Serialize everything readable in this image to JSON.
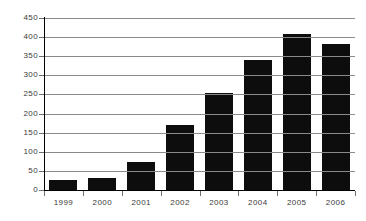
{
  "chart_data": {
    "type": "bar",
    "title": "",
    "subtitle": "",
    "xlabel": "",
    "ylabel": "",
    "categories": [
      "1999",
      "2000",
      "2001",
      "2002",
      "2003",
      "2004",
      "2005",
      "2006"
    ],
    "values": [
      27,
      32,
      74,
      171,
      253,
      340,
      407,
      383
    ],
    "series": [
      {
        "name": "",
        "values": [
          27,
          32,
          74,
          171,
          253,
          340,
          407,
          383
        ]
      }
    ],
    "ylim": [
      0,
      450
    ],
    "ytick_values": [
      0,
      50,
      100,
      150,
      200,
      250,
      300,
      350,
      400,
      450
    ],
    "ytick_labels": [
      "0",
      "50",
      "100",
      "150",
      "200",
      "250",
      "300",
      "350",
      "400",
      "450"
    ],
    "xtick_labels": [
      "1999",
      "2000",
      "2001",
      "2002",
      "2003",
      "2004",
      "2005",
      "2006"
    ],
    "grid": true,
    "grid_axis": "y",
    "legend": false,
    "legend_position": "none",
    "annotations": [],
    "colors": {
      "bar": "#0d0d0d",
      "gridline": "#8a8a8a",
      "axis": "#000000",
      "tick_label": "#3a3a3a",
      "background": "#ffffff"
    }
  }
}
